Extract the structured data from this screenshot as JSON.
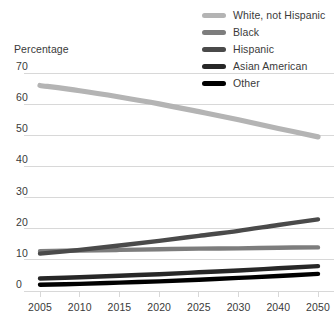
{
  "chart_data": {
    "type": "line",
    "title": "",
    "subtitle": "",
    "ylabel": "Percentage",
    "xlabel": "",
    "grid": true,
    "legend_position": "top-right",
    "x": [
      2005,
      2010,
      2015,
      2020,
      2025,
      2030,
      2040,
      2050
    ],
    "xtick_labels": [
      "2005",
      "2010",
      "2015",
      "2020",
      "2025",
      "2030",
      "2040",
      "2050"
    ],
    "ytick_labels": [
      "0",
      "10",
      "20",
      "30",
      "40",
      "50",
      "60",
      "70"
    ],
    "yticks": [
      0,
      10,
      20,
      30,
      40,
      50,
      60,
      70
    ],
    "ylim": [
      0,
      70
    ],
    "series": [
      {
        "name": "White, not Hispanic",
        "color": "#b4b4b4",
        "width": 5.2,
        "values": [
          66.0,
          64.3,
          62.3,
          60.1,
          57.6,
          55.0,
          52.2,
          49.5
        ]
      },
      {
        "name": "Black",
        "color": "#7d7d7d",
        "width": 4.4,
        "values": [
          12.8,
          13.0,
          13.2,
          13.4,
          13.6,
          13.7,
          13.9,
          14.0
        ]
      },
      {
        "name": "Hispanic",
        "color": "#4a4a4a",
        "width": 4.4,
        "values": [
          12.0,
          13.2,
          14.6,
          16.1,
          17.7,
          19.3,
          21.2,
          23.0
        ]
      },
      {
        "name": "Asian American",
        "color": "#272727",
        "width": 4.4,
        "values": [
          4.0,
          4.4,
          4.9,
          5.4,
          6.0,
          6.6,
          7.3,
          8.0
        ]
      },
      {
        "name": "Other",
        "color": "#000000",
        "width": 4.4,
        "values": [
          2.0,
          2.3,
          2.7,
          3.1,
          3.6,
          4.2,
          4.8,
          5.5
        ]
      }
    ]
  },
  "legend": {
    "items": [
      {
        "label": "White, not Hispanic",
        "color": "#b4b4b4"
      },
      {
        "label": "Black",
        "color": "#7d7d7d"
      },
      {
        "label": "Hispanic",
        "color": "#4a4a4a"
      },
      {
        "label": "Asian American",
        "color": "#272727"
      },
      {
        "label": "Other",
        "color": "#000000"
      }
    ]
  },
  "axis": {
    "y_axis_title": "Percentage"
  },
  "style": {
    "background": "#ffffff",
    "gridline_color": "#d8d8d8",
    "text_color": "#3a3a3a"
  }
}
